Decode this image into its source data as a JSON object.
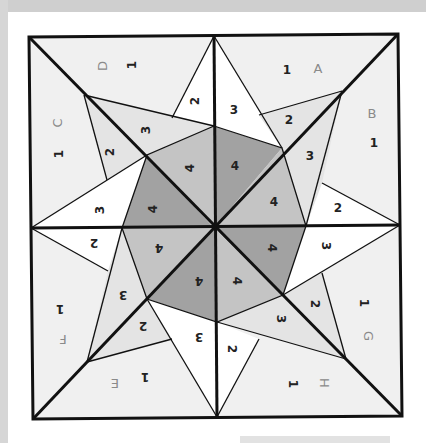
{
  "diagram": {
    "colors": {
      "background": "#f0f0f0",
      "white_piece": "#ffffff",
      "light_piece": "#e4e4e4",
      "medium_piece": "#c4c4c4",
      "dark_piece": "#a2a2a2",
      "line": "#111111",
      "section_letter": "#8a8a8a",
      "piece_number": "#222222"
    },
    "sections": [
      {
        "letter": "A",
        "pieces": [
          "1",
          "2",
          "3",
          "4"
        ]
      },
      {
        "letter": "B",
        "pieces": [
          "1",
          "2",
          "3",
          "4"
        ]
      },
      {
        "letter": "C",
        "pieces": [
          "1",
          "2",
          "3",
          "4"
        ]
      },
      {
        "letter": "D",
        "pieces": [
          "1",
          "2",
          "3",
          "4"
        ]
      },
      {
        "letter": "E",
        "pieces": [
          "1",
          "2",
          "3",
          "4"
        ]
      },
      {
        "letter": "F",
        "pieces": [
          "1",
          "2",
          "3",
          "4"
        ]
      },
      {
        "letter": "G",
        "pieces": [
          "1",
          "2",
          "3",
          "4"
        ]
      },
      {
        "letter": "H",
        "pieces": [
          "1",
          "2",
          "3",
          "4"
        ]
      }
    ],
    "labels": {
      "A": "A",
      "B": "B",
      "C": "C",
      "D": "D",
      "E": "E",
      "F": "F",
      "G": "G",
      "H": "H",
      "n1": "1",
      "n2": "2",
      "n3": "3",
      "n4": "4"
    }
  }
}
